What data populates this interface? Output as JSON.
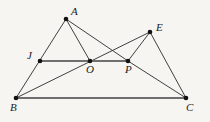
{
  "figure": {
    "kind": "geometry-diagram",
    "canvas": {
      "width": 210,
      "height": 122
    },
    "background_color": "#f6f5f2",
    "stroke_color": "#2b2b2b",
    "accent_stroke_color": "#6f6f6f",
    "vertex_color": "#111111"
  },
  "points": [
    {
      "id": "A",
      "label": "A",
      "x": 66,
      "y": 19,
      "label_x": 71,
      "label_y": 6,
      "dot": true
    },
    {
      "id": "E",
      "label": "E",
      "x": 150,
      "y": 32,
      "label_x": 156,
      "label_y": 22,
      "dot": true
    },
    {
      "id": "J",
      "label": "J",
      "x": 40,
      "y": 61,
      "label_x": 27,
      "label_y": 50,
      "dot": true
    },
    {
      "id": "O",
      "label": "O",
      "x": 90,
      "y": 61,
      "label_x": 86,
      "label_y": 64,
      "dot": true
    },
    {
      "id": "P",
      "label": "P",
      "x": 128,
      "y": 61,
      "label_x": 125,
      "label_y": 64,
      "dot": true
    },
    {
      "id": "B",
      "label": "B",
      "x": 16,
      "y": 98,
      "label_x": 10,
      "label_y": 102,
      "dot": true
    },
    {
      "id": "C",
      "label": "C",
      "x": 186,
      "y": 98,
      "label_x": 186,
      "label_y": 102,
      "dot": true
    }
  ],
  "segments": [
    {
      "id": "A-B",
      "from": "A",
      "to": "B",
      "style": "thin"
    },
    {
      "id": "A-O",
      "from": "A",
      "to": "O",
      "style": "thin"
    },
    {
      "id": "A-P",
      "from": "A",
      "to": "P",
      "style": "thin"
    },
    {
      "id": "B-E",
      "from": "B",
      "to": "E",
      "style": "thin"
    },
    {
      "id": "E-P",
      "from": "E",
      "to": "P",
      "style": "thin"
    },
    {
      "id": "E-C",
      "from": "E",
      "to": "C",
      "style": "thin"
    },
    {
      "id": "P-C",
      "from": "P",
      "to": "C",
      "style": "thin"
    },
    {
      "id": "J-P",
      "from": "J",
      "to": "P",
      "style": "thick"
    },
    {
      "id": "B-C",
      "from": "B",
      "to": "C",
      "style": "thick"
    }
  ],
  "labels_note": "All vertex labels rendered in italic serif"
}
